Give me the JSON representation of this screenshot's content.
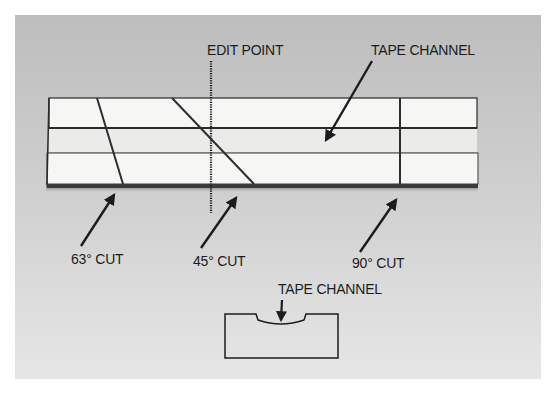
{
  "figure": {
    "title_labels": {
      "edit_point": "EDIT POINT",
      "tape_channel_top": "TAPE CHANNEL"
    },
    "cut_labels": [
      {
        "id": "cut-63",
        "label": "63° CUT",
        "angle_deg": 63
      },
      {
        "id": "cut-45",
        "label": "45° CUT",
        "angle_deg": 45
      },
      {
        "id": "cut-90",
        "label": "90° CUT",
        "angle_deg": 90
      }
    ],
    "cross_section": {
      "label": "TAPE CHANNEL"
    },
    "colors": {
      "background": "#c9c9c9",
      "block_face": "#f4f4f2",
      "channel": "#ebebea",
      "ink": "#1c1c1c"
    }
  }
}
